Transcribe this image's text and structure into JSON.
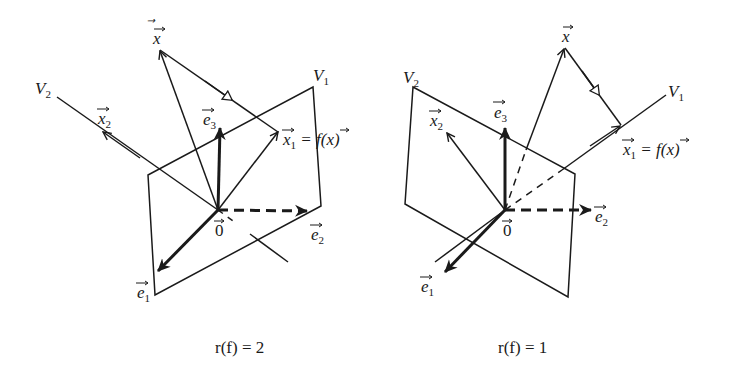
{
  "diagrams": [
    {
      "id": "rank-2",
      "caption": "r(f) = 2",
      "caption_parts": {
        "r": "r(",
        "f": "f",
        "rest": ") = 2"
      },
      "labels": {
        "V1": "V",
        "V1_sub": "1",
        "V2": "V",
        "V2_sub": "2",
        "x": "x",
        "x1": "x",
        "x1_sub": "1",
        "x1_eq": " = f(x)",
        "x2": "x",
        "x2_sub": "2",
        "e1": "e",
        "e1_sub": "1",
        "e2": "e",
        "e2_sub": "2",
        "e3": "e",
        "e3_sub": "3",
        "origin": "0"
      },
      "description": "V1 is a plane, V2 is a line; x projects onto x1 = f(x) in V1 along V2"
    },
    {
      "id": "rank-1",
      "caption": "r(f) = 1",
      "caption_parts": {
        "r": "r(",
        "f": "f",
        "rest": ") = 1"
      },
      "labels": {
        "V1": "V",
        "V1_sub": "1",
        "V2": "V",
        "V2_sub": "2",
        "x": "x",
        "x1": "x",
        "x1_sub": "1",
        "x1_eq": " = f(x)",
        "x2": "x",
        "x2_sub": "2",
        "e1": "e",
        "e1_sub": "1",
        "e2": "e",
        "e2_sub": "2",
        "e3": "e",
        "e3_sub": "3",
        "origin": "0"
      },
      "description": "V1 is a line, V2 is a plane; x projects onto x1 = f(x) on V1 along V2"
    }
  ],
  "colors": {
    "stroke": "#1a1a1a",
    "background": "#ffffff"
  }
}
